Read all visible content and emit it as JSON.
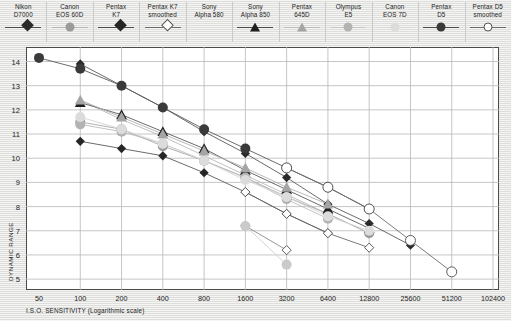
{
  "chart_data": {
    "type": "line",
    "title": "",
    "xlabel": "I.S.O. SENSITIVITY (Logarithmic scale)",
    "ylabel": "DYNAMIC RANGE",
    "xscale": "log2",
    "x_ticks": [
      "50",
      "100",
      "200",
      "400",
      "800",
      "1600",
      "3200",
      "6400",
      "12800",
      "25600",
      "51200",
      "102400"
    ],
    "x_tick_values": [
      50,
      100,
      200,
      400,
      800,
      1600,
      3200,
      6400,
      12800,
      25600,
      51200,
      102400
    ],
    "y_ticks": [
      "14",
      "13",
      "12",
      "11",
      "10",
      "9",
      "8",
      "7",
      "6",
      "5"
    ],
    "y_tick_values": [
      14,
      13,
      12,
      11,
      10,
      9,
      8,
      7,
      6,
      5
    ],
    "xlim": [
      50,
      102400
    ],
    "ylim": [
      4.55,
      14.6
    ],
    "grid": true,
    "legend_position": "top",
    "series": [
      {
        "name": "Nikon D7000",
        "marker": "diamond",
        "color": "#2b2b2b",
        "line_color": "#5a5a5a",
        "points": [
          {
            "x": 100,
            "y": 13.9
          },
          {
            "x": 200,
            "y": 13.0
          },
          {
            "x": 400,
            "y": 12.1
          },
          {
            "x": 800,
            "y": 11.1
          },
          {
            "x": 1600,
            "y": 10.2
          },
          {
            "x": 3200,
            "y": 9.2
          },
          {
            "x": 6400,
            "y": 8.1
          },
          {
            "x": 12800,
            "y": 7.3
          },
          {
            "x": 25600,
            "y": 6.4
          }
        ]
      },
      {
        "name": "Canon EOS 60D",
        "marker": "circle",
        "color": "#9b9b9b",
        "line_color": "#a8a8a8",
        "points": [
          {
            "x": 100,
            "y": 11.5
          },
          {
            "x": 200,
            "y": 11.2
          },
          {
            "x": 400,
            "y": 10.5
          },
          {
            "x": 800,
            "y": 9.9
          },
          {
            "x": 1600,
            "y": 9.2
          },
          {
            "x": 3200,
            "y": 8.4
          },
          {
            "x": 6400,
            "y": 7.7
          },
          {
            "x": 12800,
            "y": 6.9
          }
        ]
      },
      {
        "name": "Pentax K7",
        "marker": "diamond",
        "color": "#262626",
        "line_color": "#5a5a5a",
        "points": [
          {
            "x": 100,
            "y": 10.7
          },
          {
            "x": 200,
            "y": 10.4
          },
          {
            "x": 400,
            "y": 10.1
          },
          {
            "x": 800,
            "y": 9.4
          },
          {
            "x": 1600,
            "y": 8.6
          },
          {
            "x": 3200,
            "y": 7.7
          },
          {
            "x": 6400,
            "y": 6.9
          }
        ]
      },
      {
        "name": "Pentax K7 smoothed",
        "marker": "open-diamond",
        "color": "#ffffff",
        "line_color": "#6b6b6b",
        "points": [
          {
            "x": 1600,
            "y": 8.6
          },
          {
            "x": 3200,
            "y": 7.7
          },
          {
            "x": 6400,
            "y": 6.9
          },
          {
            "x": 12800,
            "y": 6.3
          }
        ]
      },
      {
        "name": "Sony Alpha 580",
        "marker": "none",
        "color": "#b9b9b9",
        "line_color": "#b9b9b9",
        "points": [
          {
            "x": 100,
            "y": 12.4
          },
          {
            "x": 200,
            "y": 11.6
          },
          {
            "x": 400,
            "y": 10.9
          },
          {
            "x": 800,
            "y": 10.1
          },
          {
            "x": 1600,
            "y": 9.3
          },
          {
            "x": 3200,
            "y": 8.5
          },
          {
            "x": 6400,
            "y": 7.7
          },
          {
            "x": 12800,
            "y": 6.9
          }
        ]
      },
      {
        "name": "Sony Alpha 850",
        "marker": "triangle",
        "color": "#1f1f1f",
        "line_color": "#5a5a5a",
        "points": [
          {
            "x": 100,
            "y": 12.3
          },
          {
            "x": 200,
            "y": 11.8
          },
          {
            "x": 400,
            "y": 11.1
          },
          {
            "x": 800,
            "y": 10.4
          },
          {
            "x": 1600,
            "y": 9.5
          },
          {
            "x": 3200,
            "y": 8.7
          },
          {
            "x": 6400,
            "y": 7.9
          },
          {
            "x": 12800,
            "y": 7.1
          }
        ]
      },
      {
        "name": "Pentax 645D",
        "marker": "triangle",
        "color": "#a5a5a5",
        "line_color": "#b0b0b0",
        "points": [
          {
            "x": 100,
            "y": 12.4
          },
          {
            "x": 200,
            "y": 11.7
          },
          {
            "x": 400,
            "y": 11.0
          },
          {
            "x": 800,
            "y": 10.3
          },
          {
            "x": 1600,
            "y": 9.6
          },
          {
            "x": 3200,
            "y": 8.8
          },
          {
            "x": 6400,
            "y": 8.1
          }
        ]
      },
      {
        "name": "Olympus E5",
        "marker": "circle",
        "color": "#b3b3b3",
        "line_color": "#bcbcbc",
        "points": [
          {
            "x": 100,
            "y": 11.4
          },
          {
            "x": 200,
            "y": 11.1
          },
          {
            "x": 400,
            "y": 10.6
          },
          {
            "x": 800,
            "y": 9.9
          },
          {
            "x": 1600,
            "y": 9.2
          },
          {
            "x": 3200,
            "y": 8.3
          },
          {
            "x": 6400,
            "y": 7.5
          }
        ]
      },
      {
        "name": "Canon EOS 7D",
        "marker": "circle",
        "color": "#dcdcdc",
        "line_color": "#d4d4d4",
        "points": [
          {
            "x": 100,
            "y": 11.7
          },
          {
            "x": 200,
            "y": 11.2
          },
          {
            "x": 400,
            "y": 10.6
          },
          {
            "x": 800,
            "y": 9.9
          },
          {
            "x": 1600,
            "y": 9.1
          },
          {
            "x": 3200,
            "y": 8.4
          },
          {
            "x": 6400,
            "y": 7.6
          },
          {
            "x": 12800,
            "y": 7.0
          }
        ]
      },
      {
        "name": "Pentax D5",
        "marker": "circle",
        "color": "#3a3a3a",
        "line_color": "#5a5a5a",
        "points": [
          {
            "x": 50,
            "y": 14.15
          },
          {
            "x": 100,
            "y": 13.7
          },
          {
            "x": 200,
            "y": 13.0
          },
          {
            "x": 400,
            "y": 12.1
          },
          {
            "x": 800,
            "y": 11.2
          },
          {
            "x": 1600,
            "y": 10.4
          },
          {
            "x": 3200,
            "y": 9.6
          },
          {
            "x": 6400,
            "y": 8.8
          },
          {
            "x": 12800,
            "y": 7.9
          }
        ]
      },
      {
        "name": "Pentax D5 smoothed",
        "marker": "open-circle",
        "color": "#ffffff",
        "line_color": "#6b6b6b",
        "points": [
          {
            "x": 3200,
            "y": 9.6
          },
          {
            "x": 6400,
            "y": 8.8
          },
          {
            "x": 12800,
            "y": 7.9
          },
          {
            "x": 25600,
            "y": 6.6
          },
          {
            "x": 51200,
            "y": 5.3
          }
        ]
      },
      {
        "name": "Canon EOS 60D low",
        "marker": "open-diamond",
        "color": "#ffffff",
        "line_color": "#8a8a8a",
        "points": [
          {
            "x": 1600,
            "y": 7.2
          },
          {
            "x": 3200,
            "y": 6.2
          }
        ]
      },
      {
        "name": "Olympus E5 low",
        "marker": "circle",
        "color": "#cacaca",
        "line_color": "#cfcfcf",
        "points": [
          {
            "x": 1600,
            "y": 7.2
          },
          {
            "x": 3200,
            "y": 5.6
          }
        ]
      }
    ]
  },
  "legend": {
    "items": [
      {
        "label": "Nikon\nD7000",
        "marker": "diamond",
        "color": "#2b2b2b",
        "line": "#4a4a4a"
      },
      {
        "label": "Canon\nEOS 60D",
        "marker": "circle",
        "color": "#9b9b9b",
        "line": "#b5b5b5"
      },
      {
        "label": "Pentax\nK7",
        "marker": "diamond",
        "color": "#262626",
        "line": "#4a4a4a"
      },
      {
        "label": "Pentax K7\nsmoothed",
        "marker": "open-diamond",
        "color": "#ffffff",
        "line": "#6b6b6b"
      },
      {
        "label": "Sony\nAlpha 580",
        "marker": "none",
        "color": "#b9b9b9",
        "line": "#ffffff"
      },
      {
        "label": "Sony\nAlpha 850",
        "marker": "triangle",
        "color": "#1f1f1f",
        "line": "#4a4a4a"
      },
      {
        "label": "Pentax\n645D",
        "marker": "triangle",
        "color": "#a5a5a5",
        "line": "#bcbcbc"
      },
      {
        "label": "Olympus\nE5",
        "marker": "circle",
        "color": "#b3b3b3",
        "line": "#c4c4c4"
      },
      {
        "label": "Canon\nEOS 7D",
        "marker": "circle",
        "color": "#dcdcdc",
        "line": "#d8d8d8"
      },
      {
        "label": "Pentax\nD5",
        "marker": "circle",
        "color": "#3a3a3a",
        "line": "#4a4a4a"
      },
      {
        "label": "Pentax D5\nsmoothed",
        "marker": "open-circle",
        "color": "#ffffff",
        "line": "#6b6b6b"
      }
    ]
  },
  "style": {
    "plot_bg": "#ffffff",
    "page_bg": "#e9e9e7",
    "grid_color": "#b8b8b8",
    "axis_color": "#4a4a4a",
    "text_color": "#1d1d1d"
  }
}
